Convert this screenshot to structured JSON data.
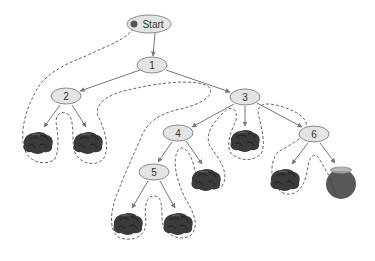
{
  "diagram": {
    "type": "search-tree",
    "nodes": [
      {
        "id": "start",
        "label": "Start",
        "x": 149,
        "y": 24
      },
      {
        "id": "n1",
        "label": "1",
        "x": 152,
        "y": 65
      },
      {
        "id": "n2",
        "label": "2",
        "x": 66,
        "y": 96
      },
      {
        "id": "n3",
        "label": "3",
        "x": 245,
        "y": 97
      },
      {
        "id": "n4",
        "label": "4",
        "x": 178,
        "y": 133
      },
      {
        "id": "n5",
        "label": "5",
        "x": 154,
        "y": 172
      },
      {
        "id": "n6",
        "label": "6",
        "x": 314,
        "y": 134
      }
    ],
    "leaves": [
      {
        "id": "rock-2a",
        "kind": "rock",
        "parent": "n2",
        "x": 38,
        "y": 142
      },
      {
        "id": "rock-2b",
        "kind": "rock",
        "parent": "n2",
        "x": 88,
        "y": 142
      },
      {
        "id": "rock-3",
        "kind": "rock",
        "parent": "n3",
        "x": 245,
        "y": 140
      },
      {
        "id": "rock-4",
        "kind": "rock",
        "parent": "n4",
        "x": 206,
        "y": 179
      },
      {
        "id": "rock-5a",
        "kind": "rock",
        "parent": "n5",
        "x": 128,
        "y": 223
      },
      {
        "id": "rock-5b",
        "kind": "rock",
        "parent": "n5",
        "x": 178,
        "y": 223
      },
      {
        "id": "rock-6",
        "kind": "rock",
        "parent": "n6",
        "x": 285,
        "y": 179
      },
      {
        "id": "gold-pot",
        "kind": "pot-of-gold",
        "parent": "n6",
        "x": 341,
        "y": 179
      }
    ],
    "path_style": "dashed traversal outline",
    "colors": {
      "node_fill": "#e4e4e4",
      "node_stroke": "#8a8a8a",
      "start_dot": "#555555",
      "rock": "#3a3a3a",
      "pot": "#585858",
      "pot_rim": "#9a9a9a",
      "edge": "#777777",
      "trail": "#555555"
    }
  }
}
